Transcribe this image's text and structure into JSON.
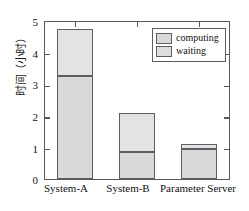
{
  "chart_data": {
    "type": "bar",
    "subtype": "stacked-vertical",
    "title": "",
    "xlabel": "",
    "ylabel": "时间（小时）",
    "ylim": [
      0,
      5
    ],
    "yticks": [
      0,
      1,
      2,
      3,
      4,
      5
    ],
    "ytick_labels": [
      "0",
      "1",
      "2",
      "3",
      "4",
      "5"
    ],
    "grid": false,
    "categories": [
      "System-A",
      "System-B",
      "Parameter Server"
    ],
    "series": [
      {
        "name": "waiting",
        "values": [
          3.27,
          0.85,
          0.97
        ]
      },
      {
        "name": "computing",
        "values": [
          1.51,
          1.26,
          0.13
        ]
      }
    ],
    "totals": [
      4.78,
      2.11,
      1.1
    ],
    "legend": {
      "position": "top-right-inside",
      "entries": [
        {
          "label": "computing",
          "color": "#d9d9d9"
        },
        {
          "label": "waiting",
          "color": "#dedede"
        }
      ]
    },
    "colors": {
      "waiting": "#d9d9d9",
      "computing": "#e3e3e3",
      "edge": "#5b5f63",
      "axis": "#555a5e",
      "background": "#ffffff"
    }
  }
}
